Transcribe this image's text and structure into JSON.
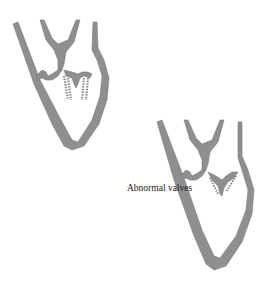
{
  "figure": {
    "label": "Abnormal valves",
    "colors": {
      "wall": "#8f8f8f",
      "wall_stroke": "#7a7a7a",
      "background": "#ffffff",
      "valve_dots": "#8a8a8a"
    },
    "panels": [
      {
        "name": "heart-top-left",
        "description": "Heart cross-section with valves"
      },
      {
        "name": "heart-bottom-right",
        "description": "Heart cross-section with abnormal valves"
      }
    ]
  }
}
